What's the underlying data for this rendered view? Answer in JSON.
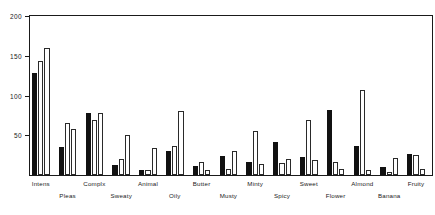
{
  "chart_data": {
    "type": "bar",
    "title": "",
    "subtitle": "",
    "xlabel": "",
    "ylabel": "",
    "ylim": [
      0,
      200
    ],
    "yticks": [
      50,
      100,
      150,
      200
    ],
    "ytick_labels": [
      "50",
      "100",
      "150",
      "200"
    ],
    "grid": false,
    "legend": "none",
    "categories": [
      "Intens",
      "Pleas",
      "Complx",
      "Sweaty",
      "Animal",
      "Oily",
      "Butter",
      "Musty",
      "Minty",
      "Spicy",
      "Sweet",
      "Flower",
      "Almond",
      "Banana",
      "Fruity"
    ],
    "series": [
      {
        "name": "series-1",
        "style": "solid-black",
        "color": "#111111",
        "values": [
          128,
          35,
          78,
          13,
          6,
          30,
          11,
          24,
          17,
          42,
          23,
          82,
          37,
          10,
          27
        ]
      },
      {
        "name": "series-2",
        "style": "open-outline",
        "color": "#ffffff",
        "values": [
          143,
          66,
          69,
          20,
          6,
          37,
          16,
          8,
          55,
          15,
          69,
          16,
          107,
          4,
          25
        ]
      },
      {
        "name": "series-3",
        "style": "open-outline",
        "color": "#ffffff",
        "values": [
          160,
          58,
          78,
          50,
          34,
          80,
          6,
          30,
          14,
          20,
          19,
          7,
          6,
          21,
          7
        ]
      }
    ]
  },
  "axis": {
    "y_min_label": "50",
    "y_mid_label": "100",
    "y_high_label": "150",
    "y_top_label": "200"
  }
}
